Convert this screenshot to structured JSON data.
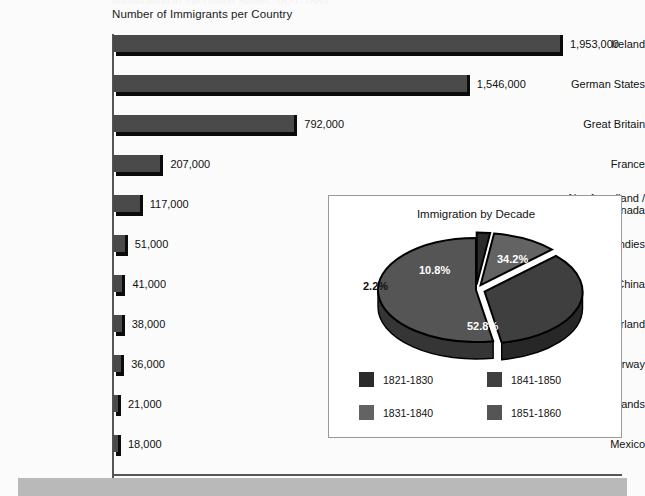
{
  "page": {
    "clipped_top_text": "Immigration to the United States, 1821-1860",
    "background_color": "#fbfbfb",
    "bottom_band_color": "#b9b9b9"
  },
  "bar_chart": {
    "title": "Number of Immigrants per Country",
    "axis_color": "#555555",
    "bar_color": "#4a4a4a",
    "bar_shadow_color": "#0b0b0b"
  },
  "pie_panel": {
    "title": "Immigration by Decade",
    "border_color": "#9a9a9a",
    "legend": [
      {
        "label": "1821-1830",
        "color": "#2b2b2b"
      },
      {
        "label": "1831-1840",
        "color": "#636363"
      },
      {
        "label": "1841-1850",
        "color": "#3f3f3f"
      },
      {
        "label": "1851-1860",
        "color": "#555555"
      }
    ]
  },
  "chart_data": [
    {
      "type": "bar",
      "orientation": "horizontal",
      "title": "Number of Immigrants per Country",
      "xlabel": "",
      "ylabel": "",
      "grid": false,
      "legend": "none",
      "xlim": [
        0,
        2100000
      ],
      "categories": [
        "Ireland",
        "German States",
        "Great Britain",
        "France",
        "Newfoundland / Canada",
        "West Indies",
        "China",
        "Switzerland",
        "Sweden / Norway",
        "Netherlands",
        "Mexico"
      ],
      "values": [
        1953000,
        1546000,
        792000,
        207000,
        117000,
        51000,
        41000,
        38000,
        36000,
        21000,
        18000
      ],
      "value_labels": [
        "1,953,000",
        "1,546,000",
        "792,000",
        "207,000",
        "117,000",
        "51,000",
        "41,000",
        "38,000",
        "36,000",
        "21,000",
        "18,000"
      ]
    },
    {
      "type": "pie",
      "title": "Immigration by Decade",
      "legend_position": "bottom",
      "exploded": true,
      "labels": [
        "1821-1830",
        "1831-1840",
        "1841-1850",
        "1851-1860"
      ],
      "values": [
        2.2,
        10.8,
        34.2,
        52.8
      ],
      "value_labels": [
        "2.2%",
        "10.8%",
        "34.2%",
        "52.8%"
      ],
      "colors": [
        "#2b2b2b",
        "#636363",
        "#3f3f3f",
        "#555555"
      ]
    }
  ]
}
